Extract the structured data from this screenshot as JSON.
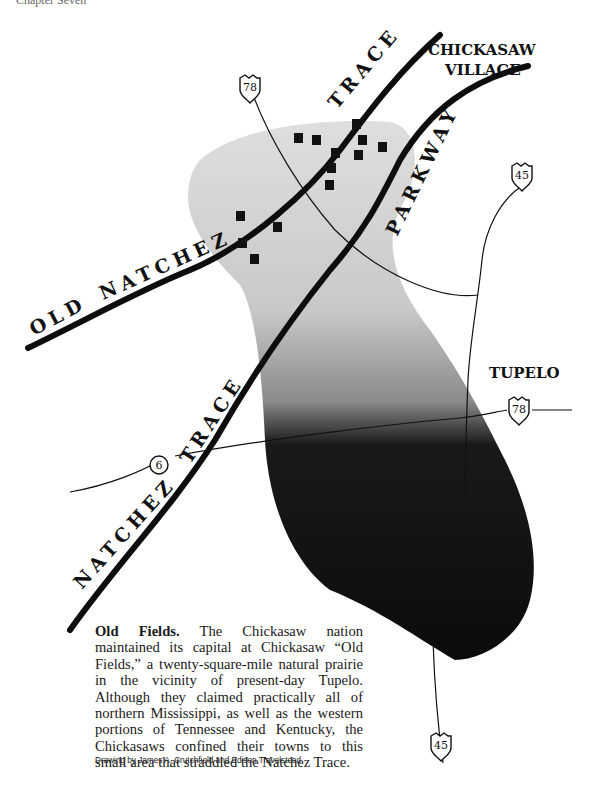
{
  "page_header": "Chapter Seven",
  "map": {
    "labels": {
      "chickasaw_village": [
        "CHICKASAW",
        "VILLAGE"
      ],
      "tupelo": "TUPELO",
      "old_natchez_trace": [
        "OLD",
        "NATCHEZ",
        "TRACE"
      ],
      "natchez_trace_parkway": [
        "NATCHEZ",
        "TRACE",
        "PARKWAY"
      ]
    },
    "highway_shields": [
      {
        "type": "us",
        "number": "78",
        "position": "top-left"
      },
      {
        "type": "us",
        "number": "45",
        "position": "top-right"
      },
      {
        "type": "us",
        "number": "78",
        "position": "right"
      },
      {
        "type": "us",
        "number": "45",
        "position": "bottom"
      },
      {
        "type": "state",
        "number": "6",
        "position": "left"
      }
    ],
    "colors": {
      "road": "#111111",
      "prairie_light": "#d2d2d2",
      "prairie_dark": "#0d0d0d",
      "town": "#111111"
    }
  },
  "caption": {
    "title": "Old Fields.",
    "body": "The Chickasaw nation maintained its capital at Chickasaw “Old Fields,” a twenty-square-mile natural prairie in the vicinity of present-day Tupelo. Although they claimed practically all of northern Mississippi, as well as the western portions of Tennessee and Kentucky, the Chickasaws confined their towns to this small area that straddled the Natchez Trace.",
    "credit": "Drawing by James A. Crutchfield and Edison Travelstead"
  }
}
